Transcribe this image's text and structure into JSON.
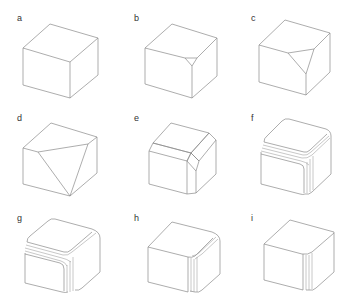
{
  "figure": {
    "panels": [
      {
        "label": "a",
        "variant": "plain-cube"
      },
      {
        "label": "b",
        "variant": "small-corner-chamfer"
      },
      {
        "label": "c",
        "variant": "medium-corner-chamfer"
      },
      {
        "label": "d",
        "variant": "large-corner-chamfer"
      },
      {
        "label": "e",
        "variant": "edge-chamfer"
      },
      {
        "label": "f",
        "variant": "rounded-edges-multiline-all"
      },
      {
        "label": "g",
        "variant": "rounded-edges-multiline-left-vertical"
      },
      {
        "label": "h",
        "variant": "rounded-vertical-edge-multiline"
      },
      {
        "label": "i",
        "variant": "rounded-vertical-edge-fewlines"
      }
    ],
    "colors": {
      "stroke": "#8a8a8a",
      "label": "#333333",
      "background": "#ffffff"
    }
  }
}
